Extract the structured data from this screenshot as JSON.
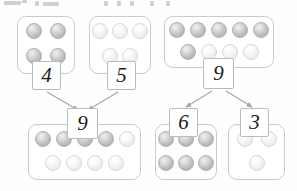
{
  "page": {
    "background_color": "#fefefe"
  },
  "colors": {
    "box_border": "#c9cbcd",
    "num_box_border": "#b9bbbd",
    "counter_dark": "#bdbdbd",
    "counter_light": "#eeeeee",
    "arrow": "#a6a8aa",
    "text": "#1b1b1b"
  },
  "header": {
    "fragment_note": "cut-off glyphs at top edge",
    "fragments": [
      {
        "left": 4,
        "top": 1,
        "width": 17,
        "height": 4
      },
      {
        "left": 22,
        "top": 0,
        "width": 5,
        "height": 3
      },
      {
        "left": 35,
        "top": 1,
        "width": 4,
        "height": 5
      },
      {
        "left": 43,
        "top": 2,
        "width": 16,
        "height": 4
      },
      {
        "left": 104,
        "top": 1,
        "width": 4,
        "height": 5
      },
      {
        "left": 117,
        "top": 1,
        "width": 4,
        "height": 5
      },
      {
        "left": 130,
        "top": 1,
        "width": 4,
        "height": 5
      },
      {
        "left": 150,
        "top": 1,
        "width": 4,
        "height": 5
      },
      {
        "left": 166,
        "top": 1,
        "width": 4,
        "height": 5
      }
    ]
  },
  "groups": [
    {
      "id": "group-4",
      "label": "4",
      "count": 4,
      "left": 17,
      "top": 16,
      "width": 58,
      "height": 58,
      "dot_size": 16,
      "gap_x": 8,
      "gap_y": 6,
      "rows": [
        [
          "dark",
          "dark"
        ],
        [
          "dark",
          "dark"
        ]
      ],
      "num_box": {
        "left": 32,
        "top": 61,
        "width": 29,
        "height": 29,
        "font_size": 21
      }
    },
    {
      "id": "group-5",
      "label": "5",
      "count": 5,
      "left": 89,
      "top": 16,
      "width": 62,
      "height": 58,
      "dot_size": 16,
      "gap_x": 4,
      "gap_y": 6,
      "rows": [
        [
          "light",
          "light",
          "light"
        ],
        [
          "light",
          "light"
        ]
      ],
      "num_box": {
        "left": 107,
        "top": 61,
        "width": 29,
        "height": 29,
        "font_size": 21
      }
    },
    {
      "id": "group-9-top",
      "label": "9",
      "count": 9,
      "left": 164,
      "top": 16,
      "width": 110,
      "height": 52,
      "dot_size": 16,
      "gap_x": 5,
      "gap_y": 4,
      "rows": [
        [
          "dark",
          "dark",
          "dark",
          "dark",
          "dark"
        ],
        [
          "dark",
          "light",
          "light",
          "light"
        ]
      ],
      "num_box": {
        "left": 203,
        "top": 58,
        "width": 31,
        "height": 31,
        "font_size": 21
      }
    },
    {
      "id": "group-9-bottom",
      "label": "9",
      "count": 9,
      "left": 28,
      "top": 124,
      "width": 113,
      "height": 56,
      "dot_size": 16,
      "gap_x": 5,
      "gap_y": 5,
      "rows": [
        [
          "dark",
          "dark",
          "dark",
          "dark",
          "light"
        ],
        [
          "light",
          "light",
          "light",
          "light"
        ]
      ],
      "num_box": {
        "left": 67,
        "top": 108,
        "width": 31,
        "height": 31,
        "font_size": 21
      }
    },
    {
      "id": "group-6",
      "label": "6",
      "count": 6,
      "left": 155,
      "top": 124,
      "width": 62,
      "height": 56,
      "dot_size": 16,
      "gap_x": 4,
      "gap_y": 5,
      "rows": [
        [
          "dark",
          "dark",
          "dark"
        ],
        [
          "dark",
          "dark",
          "dark"
        ]
      ],
      "num_box": {
        "left": 169,
        "top": 108,
        "width": 29,
        "height": 29,
        "font_size": 21
      }
    },
    {
      "id": "group-3",
      "label": "3",
      "count": 3,
      "left": 228,
      "top": 124,
      "width": 57,
      "height": 56,
      "dot_size": 16,
      "gap_x": 8,
      "gap_y": 5,
      "rows": [
        [
          "light",
          "light"
        ],
        [
          "light"
        ]
      ],
      "num_box": {
        "left": 240,
        "top": 108,
        "width": 29,
        "height": 29,
        "font_size": 21
      }
    }
  ],
  "arrows": [
    {
      "id": "arrow-4-to-9",
      "from": "4",
      "to": "9",
      "x1": 47,
      "y1": 92,
      "x2": 78,
      "y2": 110
    },
    {
      "id": "arrow-5-to-9",
      "from": "5",
      "to": "9",
      "x1": 118,
      "y1": 92,
      "x2": 88,
      "y2": 110
    },
    {
      "id": "arrow-9-to-6",
      "from": "9",
      "to": "6",
      "x1": 212,
      "y1": 91,
      "x2": 186,
      "y2": 107
    },
    {
      "id": "arrow-9-to-3",
      "from": "9",
      "to": "3",
      "x1": 226,
      "y1": 91,
      "x2": 252,
      "y2": 107
    }
  ],
  "chart_data": {
    "type": "diagram",
    "bonds": [
      {
        "parts": [
          4,
          5
        ],
        "whole": 9,
        "direction": "combine"
      },
      {
        "whole": 9,
        "parts": [
          6,
          3
        ],
        "direction": "decompose"
      }
    ],
    "counters": {
      "4": {
        "total": 4,
        "dark": 4,
        "light": 0
      },
      "5": {
        "total": 5,
        "dark": 0,
        "light": 5
      },
      "9_top": {
        "total": 9,
        "dark": 6,
        "light": 3
      },
      "9_bottom": {
        "total": 9,
        "dark": 4,
        "light": 5
      },
      "6": {
        "total": 6,
        "dark": 6,
        "light": 0
      },
      "3": {
        "total": 3,
        "dark": 0,
        "light": 3
      }
    }
  }
}
